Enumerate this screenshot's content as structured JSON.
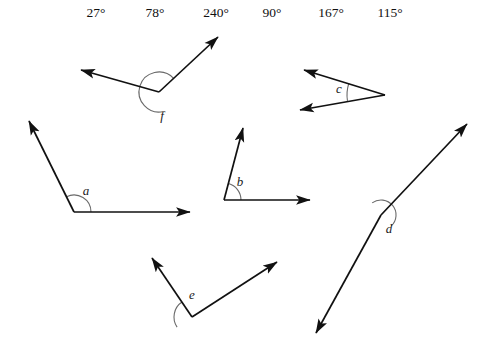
{
  "worksheet": {
    "width": 486,
    "height": 356,
    "background_color": "#ffffff",
    "stroke_color": "#111111",
    "arc_color": "#6a6a6a"
  },
  "angle_bank": {
    "measures": [
      {
        "text": "27°",
        "x": 96
      },
      {
        "text": "78°",
        "x": 155
      },
      {
        "text": "240°",
        "x": 216
      },
      {
        "text": "90°",
        "x": 272
      },
      {
        "text": "167°",
        "x": 331
      },
      {
        "text": "115°",
        "x": 390
      }
    ]
  },
  "figures": [
    {
      "id": "angle-f",
      "label": "f",
      "label_x": 162,
      "label_y": 120,
      "vertex": {
        "x": 159,
        "y": 92
      },
      "arms": [
        {
          "name": "arm-upper-right",
          "x": 218,
          "y": 37
        },
        {
          "name": "arm-left",
          "x": 81,
          "y": 70
        }
      ],
      "arc": {
        "radius": 20,
        "start_deg": 43,
        "end_deg": 283,
        "reflex": true
      }
    },
    {
      "id": "angle-c",
      "label": "c",
      "label_x": 339,
      "label_y": 93,
      "vertex": {
        "x": 385,
        "y": 95
      },
      "arms": [
        {
          "name": "arm-upper-left",
          "x": 304,
          "y": 70
        },
        {
          "name": "arm-lower-left",
          "x": 300,
          "y": 110
        }
      ],
      "arc": {
        "radius": 38,
        "start_deg": 162,
        "end_deg": 189,
        "reflex": false
      }
    },
    {
      "id": "angle-a",
      "label": "a",
      "label_x": 86,
      "label_y": 195,
      "vertex": {
        "x": 74,
        "y": 212
      },
      "arms": [
        {
          "name": "arm-right",
          "x": 190,
          "y": 212
        },
        {
          "name": "arm-upper-left",
          "x": 29,
          "y": 121
        }
      ],
      "arc": {
        "radius": 17,
        "start_deg": 0,
        "end_deg": 116,
        "reflex": false
      }
    },
    {
      "id": "angle-b",
      "label": "b",
      "label_x": 240,
      "label_y": 186,
      "vertex": {
        "x": 224,
        "y": 200
      },
      "arms": [
        {
          "name": "arm-right",
          "x": 310,
          "y": 200
        },
        {
          "name": "arm-upper-right",
          "x": 243,
          "y": 128
        }
      ],
      "arc": {
        "radius": 17,
        "start_deg": 0,
        "end_deg": 75,
        "reflex": false
      }
    },
    {
      "id": "angle-e",
      "label": "e",
      "label_x": 192,
      "label_y": 299,
      "vertex": {
        "x": 192,
        "y": 317
      },
      "arms": [
        {
          "name": "arm-upper-left",
          "x": 152,
          "y": 258
        },
        {
          "name": "arm-upper-right",
          "x": 277,
          "y": 262
        }
      ],
      "arc": {
        "radius": 18,
        "start_deg": 124,
        "end_deg": 214,
        "reflex": false
      }
    },
    {
      "id": "angle-d",
      "label": "d",
      "label_x": 389,
      "label_y": 233,
      "vertex": {
        "x": 381,
        "y": 215
      },
      "arms": [
        {
          "name": "arm-upper-right",
          "x": 467,
          "y": 124
        },
        {
          "name": "arm-lower-left",
          "x": 316,
          "y": 333
        }
      ],
      "arc": {
        "radius": 15,
        "start_deg": 313,
        "end_deg": 126,
        "reflex": false
      }
    }
  ]
}
